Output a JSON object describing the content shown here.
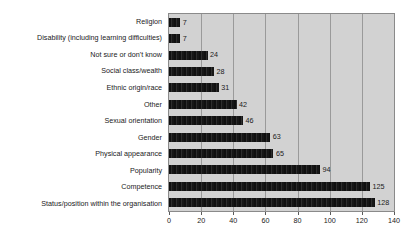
{
  "chart_data": {
    "type": "bar",
    "orientation": "horizontal",
    "title": "",
    "subtitle": "",
    "xlabel": "",
    "ylabel": "",
    "xlim": [
      0,
      140
    ],
    "xticks": [
      0,
      20,
      40,
      60,
      80,
      100,
      120,
      140
    ],
    "xtick_labels": [
      "0",
      "20",
      "40",
      "60",
      "80",
      "100",
      "120",
      "140"
    ],
    "grid": true,
    "grid_axis": "x",
    "legend": false,
    "show_value_labels": true,
    "categories": [
      "Religion",
      "Disability (including learning difficulties)",
      "Not sure or don't know",
      "Social class/wealth",
      "Ethnic origin/race",
      "Other",
      "Sexual orientation",
      "Gender",
      "Physical appearance",
      "Popularity",
      "Competence",
      "Status/position within the organisation"
    ],
    "values": [
      7,
      7,
      24,
      28,
      31,
      42,
      46,
      63,
      65,
      94,
      125,
      128
    ],
    "value_labels": [
      "7",
      "7",
      "24",
      "28",
      "31",
      "42",
      "46",
      "63",
      "65",
      "94",
      "125",
      "128"
    ],
    "colors": {
      "bar": "#1c1c1c",
      "plot_background": "#d2d2d2",
      "figure_background": "#ffffff",
      "gridline": "#9a9a9a",
      "axis_border": "#8a8a8a",
      "text": "#1a1a1a"
    }
  }
}
